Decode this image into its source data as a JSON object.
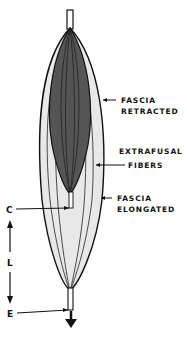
{
  "diagram": {
    "title": "",
    "labels": {
      "fascia_retracted": [
        "FASCIA",
        "RETRACTED"
      ],
      "extrafusal_fibers": [
        "EXTRAFUSAL",
        "FIBERS"
      ],
      "fascia_elongated": [
        "FASCIA",
        "ELONGATED"
      ],
      "c": "C",
      "l": "L",
      "e": "E"
    },
    "colors": {
      "outline": "#111111",
      "dark_muscle": "#555555",
      "light_fascia": "#e8e8e8",
      "background": "#ffffff"
    },
    "arrow_direction": "down"
  }
}
